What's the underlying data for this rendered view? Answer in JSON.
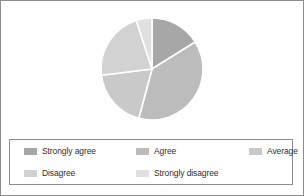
{
  "chart_data": {
    "type": "pie",
    "title": "",
    "subtitle": "",
    "xlabel": "",
    "ylabel": "",
    "grid": false,
    "legend_position": "bottom",
    "start_angle_deg": 0,
    "direction": "clockwise",
    "categories": [
      "Strongly agree",
      "Agree",
      "Average",
      "Disagree",
      "Strongly disagree"
    ],
    "values": [
      16,
      38,
      19,
      22,
      5
    ],
    "unit": "percent",
    "slices": [
      {
        "label": "Strongly agree",
        "value": 16,
        "start_deg": 0,
        "end_deg": 58,
        "color": "#a7a7a7"
      },
      {
        "label": "Agree",
        "value": 38,
        "start_deg": 58,
        "end_deg": 195,
        "color": "#bcbcbc"
      },
      {
        "label": "Average",
        "value": 19,
        "start_deg": 195,
        "end_deg": 263,
        "color": "#c9c9c9"
      },
      {
        "label": "Disagree",
        "value": 22,
        "start_deg": 263,
        "end_deg": 342,
        "color": "#d2d2d2"
      },
      {
        "label": "Strongly disagree",
        "value": 5,
        "start_deg": 342,
        "end_deg": 360,
        "color": "#e0e0e0"
      }
    ],
    "geometry": {
      "center_x": 151,
      "center_y": 64,
      "radius": 51,
      "separator_color": "#ffffff",
      "separator_width": 1.6
    }
  },
  "legend": {
    "entries": [
      {
        "label": "Strongly agree",
        "color": "#a7a7a7",
        "swatch": "legend-swatch-strongly-agree"
      },
      {
        "label": "Agree",
        "color": "#bcbcbc",
        "swatch": "legend-swatch-agree"
      },
      {
        "label": "Average",
        "color": "#c9c9c9",
        "swatch": "legend-swatch-average"
      },
      {
        "label": "Disagree",
        "color": "#d2d2d2",
        "swatch": "legend-swatch-disagree"
      },
      {
        "label": "Strongly disagree",
        "color": "#e0e0e0",
        "swatch": "legend-swatch-strongly-disagree"
      }
    ]
  },
  "colors": {
    "frame_border": "#8d8d8d",
    "legend_border": "#8d8d8d",
    "background": "#ffffff",
    "label_text": "#2f2f2f"
  }
}
